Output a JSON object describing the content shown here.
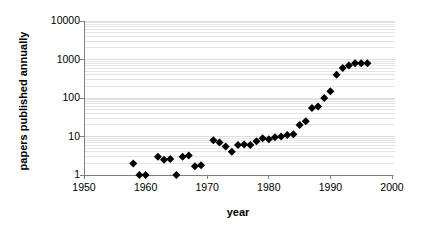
{
  "chart_data": {
    "type": "scatter",
    "title": "",
    "subtitle": "",
    "xlabel": "year",
    "ylabel": "papers published annually",
    "xlim": [
      1950,
      2000
    ],
    "ylim": [
      1,
      10000
    ],
    "yscale": "log",
    "xscale": "linear",
    "grid": "horizontal minor log gridlines, light gray",
    "legend": "none",
    "xticks": [
      1950,
      1960,
      1970,
      1980,
      1990,
      2000
    ],
    "xtick_labels": [
      "1950",
      "1960",
      "1970",
      "1980",
      "1990",
      "2000"
    ],
    "yticks": [
      1,
      10,
      100,
      1000,
      10000
    ],
    "ytick_labels": [
      "1",
      "10",
      "100",
      "1000",
      "10000"
    ],
    "marker": "filled black diamond",
    "marker_color": "#000000",
    "gridline_color": "#d9d9d9",
    "axis_color": "#808080",
    "series": [
      {
        "name": "papers published annually",
        "x": [
          1958,
          1959,
          1960,
          1962,
          1963,
          1964,
          1965,
          1966,
          1967,
          1968,
          1969,
          1971,
          1972,
          1973,
          1974,
          1975,
          1976,
          1977,
          1978,
          1979,
          1980,
          1981,
          1982,
          1983,
          1984,
          1985,
          1986,
          1987,
          1988,
          1989,
          1990,
          1991,
          1992,
          1993,
          1994,
          1995,
          1996
        ],
        "y": [
          2,
          1,
          1,
          3,
          2.5,
          2.6,
          1,
          3,
          3.2,
          1.7,
          1.8,
          8,
          7,
          5.5,
          4,
          6,
          6.2,
          6,
          7.5,
          9,
          8.5,
          9.5,
          10,
          11,
          11.5,
          20,
          25,
          55,
          60,
          100,
          150,
          400,
          600,
          700,
          800,
          800,
          800
        ]
      }
    ]
  },
  "axes": {
    "x_pixel_min": 84,
    "x_pixel_max": 392,
    "y_pixel_top": 21,
    "y_pixel_bottom": 175
  }
}
